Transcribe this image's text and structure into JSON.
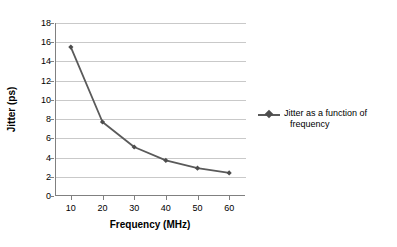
{
  "chart_data": {
    "type": "line",
    "title": "",
    "xlabel": "Frequency (MHz)",
    "ylabel": "Jitter (ps)",
    "x": [
      10,
      20,
      30,
      40,
      50,
      60
    ],
    "xtick_labels": [
      "10",
      "20",
      "30",
      "40",
      "50",
      "60"
    ],
    "xlim": [
      5,
      65
    ],
    "ylim": [
      0,
      18
    ],
    "ytick_labels": [
      "0",
      "2",
      "4",
      "6",
      "8",
      "10",
      "12",
      "14",
      "16",
      "18"
    ],
    "yticks": [
      0,
      2,
      4,
      6,
      8,
      10,
      12,
      14,
      16,
      18
    ],
    "grid": "horizontal",
    "legend_position": "right",
    "series": [
      {
        "name": "Jitter as a function of frequency",
        "name_line1": "Jitter as a function of",
        "name_line2": "frequency",
        "values": [
          15.5,
          7.7,
          5.1,
          3.7,
          2.9,
          2.4
        ],
        "line_color": "#5a5a5a",
        "marker_color": "#4d4d4d",
        "marker": "diamond"
      }
    ],
    "colors": {
      "background": "#ffffff",
      "grid": "#c9c9c9",
      "axis": "#808080",
      "text": "#000000",
      "series": "#5a5a5a"
    }
  }
}
